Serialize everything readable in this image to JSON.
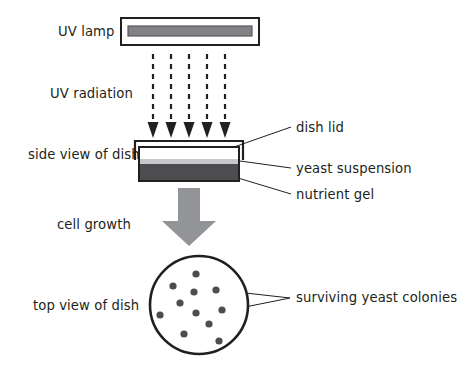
{
  "diagram": {
    "background_color": "#ffffff",
    "outline_color": "#231f20",
    "labels": {
      "uv_lamp": "UV lamp",
      "uv_radiation": "UV radiation",
      "side_view_of_dish": "side view of dish",
      "cell_growth": "cell growth",
      "top_view_of_dish": "top view of dish",
      "dish_lid": "dish lid",
      "yeast_suspension": "yeast suspension",
      "nutrient_gel": "nutrient gel",
      "surviving_yeast_colonies": "surviving yeast colonies"
    },
    "uv_lamp": {
      "housing": {
        "x": 121,
        "y": 18,
        "width": 138,
        "height": 27,
        "fill": "#ffffff",
        "stroke": "#231f20"
      },
      "tube": {
        "x": 128,
        "y": 26,
        "width": 124,
        "height": 10,
        "fill": "#808285",
        "stroke": "#58595b"
      }
    },
    "uv_rays": {
      "count": 5,
      "x_positions": [
        153,
        171,
        189,
        207,
        225
      ],
      "y_start": 54,
      "y_end": 137,
      "stroke": "#231f20",
      "stroke_width": 2.2,
      "dash": "5,5",
      "arrow_fill": "#231f20"
    },
    "side_dish": {
      "lid": {
        "x": 135,
        "y": 141,
        "width": 108,
        "height": 19,
        "stroke": "#231f20",
        "fill": "#ffffff"
      },
      "body": {
        "x": 139,
        "y": 146,
        "width": 100,
        "height": 35,
        "stroke": "#231f20",
        "fill": "#ffffff"
      },
      "yeast_layer": {
        "x": 140,
        "y": 160,
        "width": 98,
        "height": 4,
        "fill": "#c7c8ca"
      },
      "gel_layer": {
        "x": 140,
        "y": 164,
        "width": 98,
        "height": 16,
        "fill": "#4d4d4f"
      }
    },
    "growth_arrow": {
      "fill": "#929497",
      "shaft_x": 178,
      "shaft_width": 22,
      "shaft_top": 188,
      "shaft_bottom": 222,
      "head_left": 162,
      "head_right": 216,
      "head_tip_y": 245
    },
    "petri_dish": {
      "center_x": 199,
      "center_y": 305,
      "radius": 49,
      "stroke": "#231f20",
      "stroke_width": 2.6,
      "fill": "#ffffff",
      "colony_fill": "#4d4d4f",
      "colony_radius": 3.6,
      "colonies": [
        {
          "x": 196,
          "y": 274
        },
        {
          "x": 173,
          "y": 286
        },
        {
          "x": 194,
          "y": 292
        },
        {
          "x": 216,
          "y": 290
        },
        {
          "x": 180,
          "y": 303
        },
        {
          "x": 160,
          "y": 315
        },
        {
          "x": 196,
          "y": 313
        },
        {
          "x": 222,
          "y": 310
        },
        {
          "x": 209,
          "y": 324
        },
        {
          "x": 184,
          "y": 334
        },
        {
          "x": 219,
          "y": 341
        }
      ],
      "colony_count": 11
    },
    "leader_lines": {
      "stroke": "#231f20",
      "stroke_width": 1,
      "dish_lid": [
        {
          "x1": 236,
          "y1": 146
        },
        {
          "x2": 290,
          "y2": 128
        }
      ],
      "yeast_suspension": [
        {
          "x1": 240,
          "y1": 162
        },
        {
          "x2": 290,
          "y2": 168
        }
      ],
      "nutrient_gel": [
        {
          "x1": 238,
          "y1": 177
        },
        {
          "x2": 290,
          "y2": 194
        }
      ],
      "colonies_upper": [
        {
          "x1": 219,
          "y1": 290
        },
        {
          "x2": 288,
          "y2": 297
        }
      ],
      "colonies_lower": [
        {
          "x1": 224,
          "y1": 311
        },
        {
          "x2": 288,
          "y2": 297
        }
      ]
    },
    "text_positions": {
      "uv_lamp": {
        "x": 58,
        "y": 36,
        "anchor": "start"
      },
      "uv_radiation": {
        "x": 50,
        "y": 98,
        "anchor": "start"
      },
      "side_view_of_dish": {
        "x": 28,
        "y": 159,
        "anchor": "start"
      },
      "cell_growth": {
        "x": 57,
        "y": 229,
        "anchor": "start"
      },
      "top_view_of_dish": {
        "x": 33,
        "y": 310,
        "anchor": "start"
      },
      "dish_lid": {
        "x": 296,
        "y": 132,
        "anchor": "start"
      },
      "yeast_suspension": {
        "x": 296,
        "y": 173,
        "anchor": "start"
      },
      "nutrient_gel": {
        "x": 296,
        "y": 199,
        "anchor": "start"
      },
      "surviving_yeast_colonies": {
        "x": 296,
        "y": 302,
        "anchor": "start"
      }
    }
  }
}
